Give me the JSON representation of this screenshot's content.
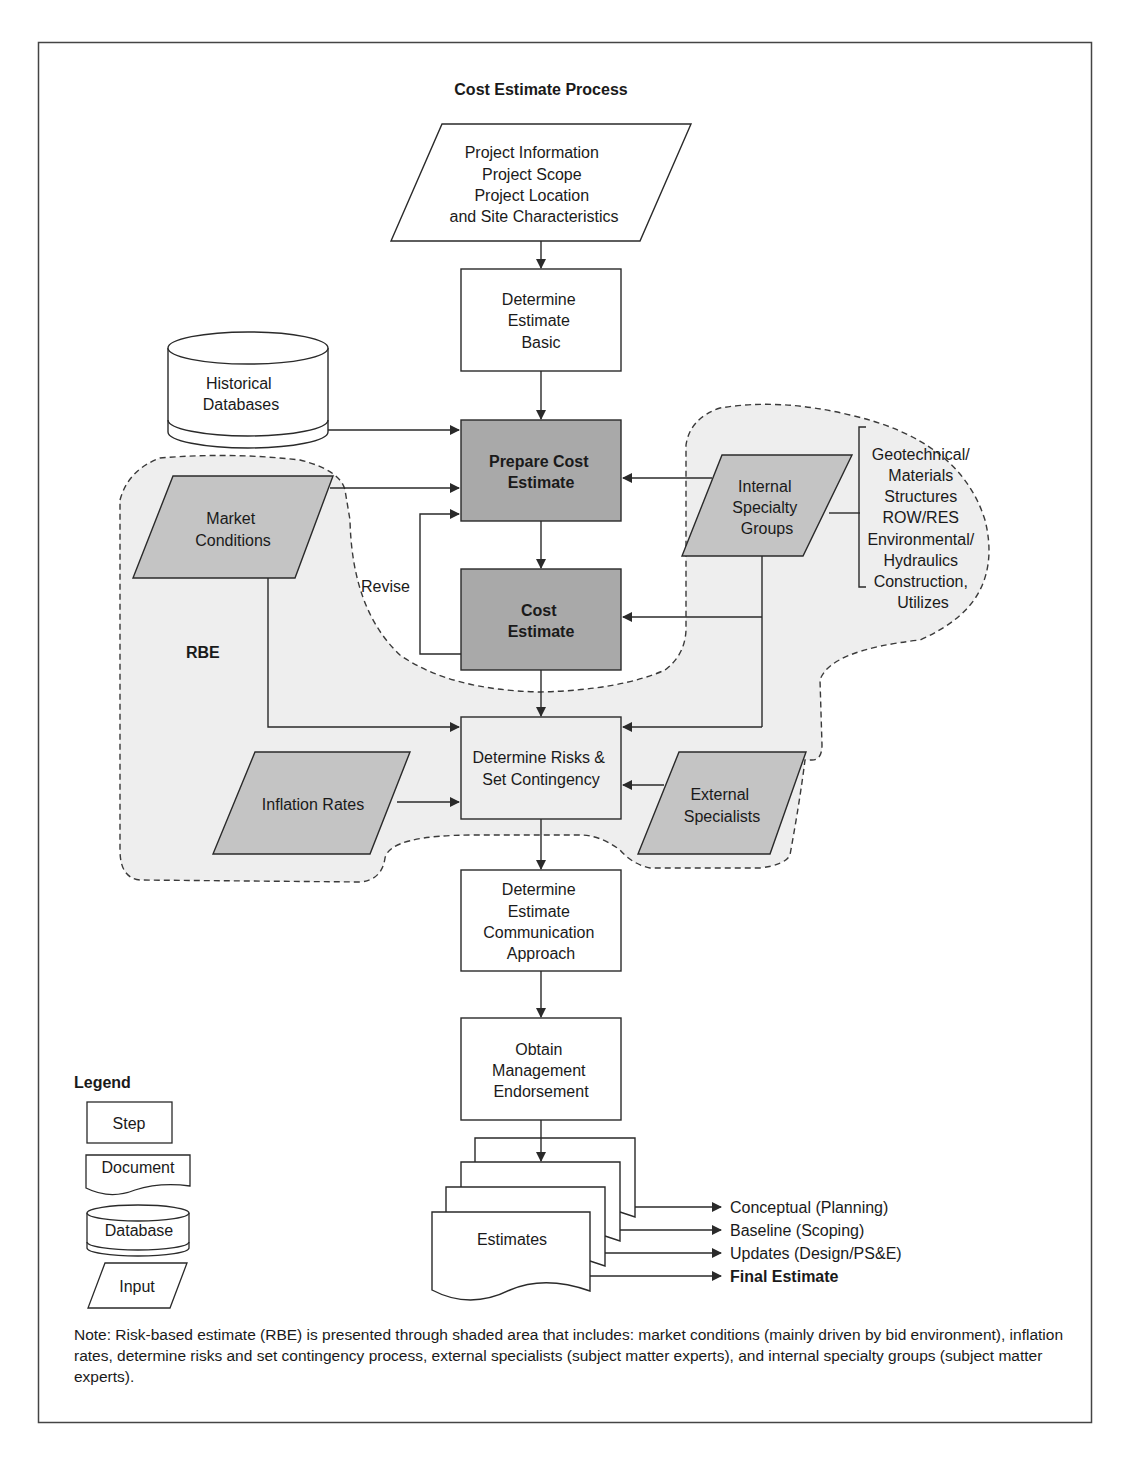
{
  "title": "Cost Estimate Process",
  "colors": {
    "line": "#2a2a2a",
    "shaded_box": "#a9a9a9",
    "shaded_input": "#c4c4c4",
    "rbe_area": "#eeeeee",
    "white": "#ffffff"
  },
  "nodes": {
    "project_info": {
      "type": "input",
      "lines": [
        "Project Information",
        "Project Scope",
        "Project Location",
        "and Site Characteristics"
      ]
    },
    "determine_basic": {
      "type": "step",
      "lines": [
        "Determine",
        "Estimate",
        "Basic"
      ]
    },
    "historical_db": {
      "type": "database",
      "lines": [
        "Historical",
        "Databases"
      ]
    },
    "prepare_cost": {
      "type": "step",
      "shaded": true,
      "lines": [
        "Prepare Cost",
        "Estimate"
      ]
    },
    "market_conditions": {
      "type": "input",
      "shaded": true,
      "lines": [
        "Market",
        "Conditions"
      ]
    },
    "internal_specialty": {
      "type": "input",
      "shaded": true,
      "lines": [
        "Internal",
        "Specialty",
        "Groups"
      ]
    },
    "specialty_list": {
      "lines": [
        "Geotechnical/",
        "Materials",
        "Structures",
        "ROW/RES",
        "Environmental/",
        "Hydraulics",
        "Construction,",
        "Utilizes"
      ]
    },
    "revise": {
      "label": "Revise"
    },
    "cost_estimate": {
      "type": "step",
      "shaded": true,
      "lines": [
        "Cost",
        "Estimate"
      ]
    },
    "rbe": {
      "label": "RBE"
    },
    "determine_risks": {
      "type": "step",
      "lines": [
        "Determine Risks &",
        "Set Contingency"
      ]
    },
    "inflation_rates": {
      "type": "input",
      "shaded": true,
      "lines": [
        "Inflation Rates"
      ]
    },
    "external_specialists": {
      "type": "input",
      "shaded": true,
      "lines": [
        "External",
        "Specialists"
      ]
    },
    "communication": {
      "type": "step",
      "lines": [
        "Determine",
        "Estimate",
        "Communication",
        "Approach"
      ]
    },
    "management": {
      "type": "step",
      "lines": [
        "Obtain",
        "Management",
        "Endorsement"
      ]
    },
    "estimates": {
      "type": "document",
      "lines": [
        "Estimates"
      ]
    }
  },
  "outputs": [
    {
      "label": "Conceptual (Planning)",
      "bold": false
    },
    {
      "label": "Baseline (Scoping)",
      "bold": false
    },
    {
      "label": "Updates (Design/PS&E)",
      "bold": false
    },
    {
      "label": "Final Estimate",
      "bold": true
    }
  ],
  "legend": {
    "title": "Legend",
    "items": [
      {
        "shape": "step",
        "label": "Step"
      },
      {
        "shape": "document",
        "label": "Document"
      },
      {
        "shape": "database",
        "label": "Database"
      },
      {
        "shape": "input",
        "label": "Input"
      }
    ]
  },
  "note": "Note: Risk-based estimate (RBE) is presented through shaded area that includes: market conditions (mainly driven by bid environment), inflation rates, determine risks and set contingency process, external specialists (subject matter experts), and internal specialty groups (subject matter experts)."
}
